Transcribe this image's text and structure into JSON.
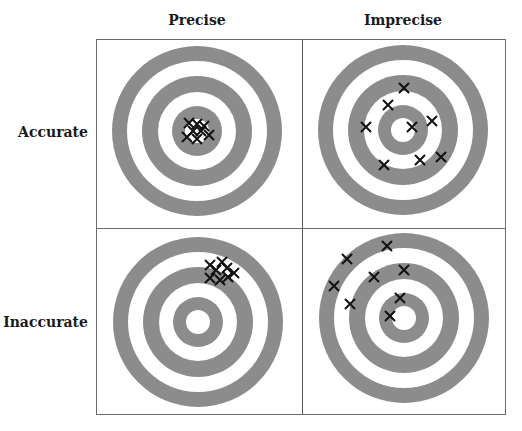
{
  "column_headers": [
    "Precise",
    "Imprecise"
  ],
  "row_headers": [
    "Accurate",
    "Inaccurate"
  ],
  "colors": {
    "ring_gray": "#8c8c8c",
    "ring_white": "#ffffff",
    "mark": "#111111",
    "grid_border": "#6b6b6b"
  },
  "target_ring_radii": [
    85,
    70,
    55,
    39,
    25,
    12
  ],
  "cells": [
    {
      "row": "Accurate",
      "col": "Precise",
      "center": [
        197,
        131
      ],
      "marks": [
        [
          189,
          123
        ],
        [
          197,
          124
        ],
        [
          204,
          126
        ],
        [
          193,
          131
        ],
        [
          201,
          131
        ],
        [
          209,
          135
        ],
        [
          197,
          139
        ],
        [
          187,
          137
        ]
      ]
    },
    {
      "row": "Accurate",
      "col": "Imprecise",
      "center": [
        403,
        130
      ],
      "marks": [
        [
          404,
          88
        ],
        [
          388,
          105
        ],
        [
          366,
          127
        ],
        [
          412,
          127
        ],
        [
          432,
          121
        ],
        [
          384,
          165
        ],
        [
          420,
          160
        ],
        [
          441,
          157
        ]
      ]
    },
    {
      "row": "Inaccurate",
      "col": "Precise",
      "center": [
        198,
        322
      ],
      "marks": [
        [
          210,
          265
        ],
        [
          222,
          262
        ],
        [
          216,
          270
        ],
        [
          227,
          268
        ],
        [
          234,
          273
        ],
        [
          210,
          278
        ],
        [
          220,
          280
        ],
        [
          228,
          277
        ]
      ]
    },
    {
      "row": "Inaccurate",
      "col": "Imprecise",
      "center": [
        404,
        318
      ],
      "marks": [
        [
          387,
          246
        ],
        [
          347,
          259
        ],
        [
          374,
          277
        ],
        [
          404,
          270
        ],
        [
          334,
          286
        ],
        [
          350,
          304
        ],
        [
          400,
          298
        ],
        [
          390,
          316
        ]
      ]
    }
  ]
}
